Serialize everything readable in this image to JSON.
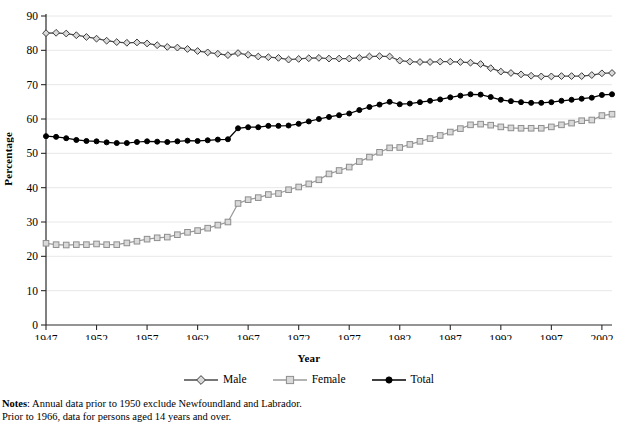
{
  "chart_data": {
    "type": "line",
    "title": "",
    "xlabel": "Year",
    "ylabel": "Percentage",
    "xlim": [
      1947,
      2003
    ],
    "ylim": [
      0,
      90
    ],
    "ytick_step": 10,
    "grid": true,
    "legend_position": "bottom",
    "yticks": [
      0,
      10,
      20,
      30,
      40,
      50,
      60,
      70,
      80,
      90
    ],
    "xticks": [
      1947,
      1952,
      1957,
      1962,
      1967,
      1972,
      1977,
      1982,
      1987,
      1992,
      1997,
      2002
    ],
    "x": [
      1947,
      1948,
      1949,
      1950,
      1951,
      1952,
      1953,
      1954,
      1955,
      1956,
      1957,
      1958,
      1959,
      1960,
      1961,
      1962,
      1963,
      1964,
      1965,
      1966,
      1967,
      1968,
      1969,
      1970,
      1971,
      1972,
      1973,
      1974,
      1975,
      1976,
      1977,
      1978,
      1979,
      1980,
      1981,
      1982,
      1983,
      1984,
      1985,
      1986,
      1987,
      1988,
      1989,
      1990,
      1991,
      1992,
      1993,
      1994,
      1995,
      1996,
      1997,
      1998,
      1999,
      2000,
      2001,
      2002,
      2003
    ],
    "series": [
      {
        "name": "Male",
        "color": "#4a4a4a",
        "marker": "open-diamond",
        "values": [
          85.0,
          85.1,
          84.9,
          84.4,
          83.9,
          83.4,
          82.8,
          82.4,
          82.2,
          82.3,
          82.0,
          81.5,
          81.0,
          80.8,
          80.4,
          79.8,
          79.4,
          79.0,
          78.6,
          79.2,
          78.7,
          78.2,
          78.0,
          77.8,
          77.3,
          77.5,
          77.7,
          77.8,
          77.6,
          77.6,
          77.6,
          77.8,
          78.2,
          78.3,
          78.2,
          77.0,
          76.7,
          76.6,
          76.6,
          76.7,
          76.7,
          76.6,
          76.4,
          76.0,
          74.8,
          73.8,
          73.4,
          73.0,
          72.6,
          72.4,
          72.4,
          72.5,
          72.5,
          72.5,
          72.8,
          73.3,
          73.4
        ]
      },
      {
        "name": "Female",
        "color": "#9a9a9a",
        "marker": "open-square",
        "values": [
          23.8,
          23.4,
          23.3,
          23.4,
          23.4,
          23.6,
          23.4,
          23.4,
          23.9,
          24.4,
          25.0,
          25.4,
          25.6,
          26.3,
          27.0,
          27.5,
          28.2,
          29.1,
          30.0,
          35.4,
          36.5,
          37.1,
          38.0,
          38.3,
          39.4,
          40.2,
          41.1,
          42.3,
          44.0,
          45.0,
          46.0,
          47.6,
          48.9,
          50.3,
          51.6,
          51.7,
          52.6,
          53.5,
          54.3,
          55.2,
          56.2,
          57.2,
          58.3,
          58.5,
          58.2,
          57.7,
          57.4,
          57.3,
          57.3,
          57.3,
          57.7,
          58.3,
          58.8,
          59.5,
          59.7,
          61.0,
          61.4
        ]
      },
      {
        "name": "Total",
        "color": "#000000",
        "marker": "filled-circle",
        "values": [
          55.0,
          54.8,
          54.4,
          53.9,
          53.6,
          53.5,
          53.2,
          53.0,
          53.0,
          53.3,
          53.5,
          53.4,
          53.3,
          53.5,
          53.7,
          53.6,
          53.8,
          54.0,
          54.1,
          57.3,
          57.6,
          57.6,
          58.0,
          58.0,
          58.1,
          58.6,
          59.3,
          60.0,
          60.6,
          61.1,
          61.6,
          62.6,
          63.5,
          64.2,
          65.0,
          64.3,
          64.5,
          64.9,
          65.3,
          65.7,
          66.3,
          66.8,
          67.2,
          67.1,
          66.4,
          65.6,
          65.2,
          64.9,
          64.7,
          64.7,
          64.9,
          65.3,
          65.6,
          65.9,
          66.2,
          67.0,
          67.2
        ]
      }
    ]
  },
  "legend": {
    "items": [
      {
        "label": "Male"
      },
      {
        "label": "Female"
      },
      {
        "label": "Total"
      }
    ]
  },
  "notes": {
    "heading": "Notes",
    "separator": ":",
    "line1": "Annual data prior to 1950 exclude Newfoundland and Labrador.",
    "line2": "Prior to 1966, data for persons aged 14 years and over."
  }
}
